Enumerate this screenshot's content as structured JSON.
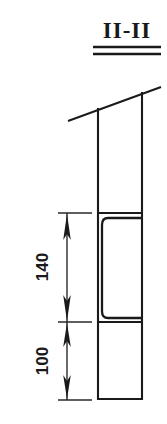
{
  "drawing": {
    "title": "II-II",
    "title_parts": {
      "left_numeral": "II",
      "separator": "-",
      "right_numeral": "II"
    },
    "kind": "section-view",
    "line_color": "#1a1a1a",
    "background_color": "#ffffff"
  },
  "dimensions": [
    {
      "id": "upper",
      "label": "140",
      "orientation": "vertical",
      "text_rotation_deg": -90,
      "arrow_style": "double-headed",
      "span_px": {
        "top": 213,
        "bottom": 322
      }
    },
    {
      "id": "lower",
      "label": "100",
      "orientation": "vertical",
      "text_rotation_deg": -90,
      "arrow_style": "double-headed",
      "span_px": {
        "top": 322,
        "bottom": 400
      }
    }
  ],
  "geometry": {
    "column": {
      "name": "vertical-column",
      "left": 97,
      "right": 143,
      "top": 95,
      "bottom": 400
    },
    "slope_line": {
      "name": "sloped-roof-line",
      "x1": 68,
      "y1": 121,
      "x2": 161,
      "y2": 87
    },
    "recess": {
      "name": "recessed-opening",
      "left": 101,
      "right": 143,
      "top": 217,
      "bottom": 318,
      "corner_radius": 7
    },
    "dividers": [
      {
        "name": "upper-divider-line",
        "y": 213
      },
      {
        "name": "lower-divider-line",
        "y": 322
      }
    ],
    "title_underlines": [
      {
        "name": "title-underline-outer",
        "y": 47,
        "x1": 93,
        "x2": 161
      },
      {
        "name": "title-underline-inner",
        "y": 54,
        "x1": 93,
        "x2": 161
      }
    ]
  }
}
